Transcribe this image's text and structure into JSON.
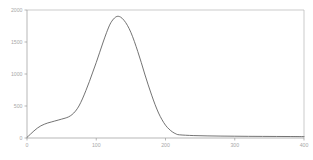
{
  "chart_data": {
    "type": "line",
    "title": "",
    "subtitle": "",
    "xlabel": "",
    "ylabel": "",
    "xlim": [
      0,
      400
    ],
    "ylim": [
      0,
      2000
    ],
    "grid": false,
    "legend": null,
    "x_ticks": [
      0,
      100,
      200,
      300,
      400
    ],
    "x_tick_labels": [
      "0",
      "100",
      "200",
      "300",
      "400"
    ],
    "y_ticks": [
      0,
      500,
      1000,
      1500,
      2000
    ],
    "y_tick_labels": [
      "0",
      "500",
      "1000",
      "1500",
      "2000"
    ],
    "series": [
      {
        "name": "distribution",
        "color": "#5a5a5a",
        "x": [
          0,
          5,
          10,
          15,
          20,
          25,
          30,
          35,
          40,
          45,
          50,
          55,
          60,
          65,
          70,
          75,
          80,
          85,
          90,
          95,
          100,
          105,
          110,
          115,
          120,
          125,
          130,
          135,
          140,
          145,
          150,
          155,
          160,
          165,
          170,
          175,
          180,
          185,
          190,
          195,
          200,
          205,
          210,
          215,
          220,
          240,
          260,
          280,
          300,
          320,
          340,
          360,
          380,
          400
        ],
        "y": [
          10,
          60,
          110,
          155,
          190,
          215,
          235,
          250,
          265,
          280,
          295,
          310,
          330,
          365,
          420,
          500,
          610,
          740,
          880,
          1030,
          1180,
          1340,
          1500,
          1650,
          1780,
          1860,
          1900,
          1890,
          1840,
          1760,
          1650,
          1510,
          1350,
          1180,
          1000,
          830,
          670,
          520,
          390,
          285,
          200,
          140,
          95,
          65,
          50,
          38,
          33,
          30,
          28,
          26,
          25,
          24,
          23,
          22
        ]
      }
    ],
    "colors": {
      "curve": "#5a5a5a",
      "axis": "#9a9a9a",
      "frame": "#b4b4b4",
      "tick_label": "#a8a8a8",
      "background": "#ffffff"
    }
  }
}
